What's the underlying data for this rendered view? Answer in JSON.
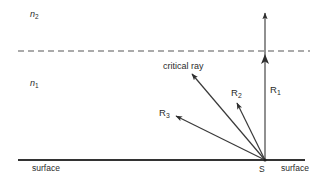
{
  "figure": {
    "width": 322,
    "height": 185,
    "background_color": "#ffffff",
    "line_color": "#3a3a3a",
    "dashed_line_color": "#8a8a8a",
    "text_color": "#2b2b2b"
  },
  "labels": {
    "medium_upper": "n",
    "medium_upper_sub": "2",
    "medium_lower": "n",
    "medium_lower_sub": "1",
    "critical_ray": "critical ray",
    "ray1": "R",
    "ray1_sub": "1",
    "ray2": "R",
    "ray2_sub": "2",
    "ray3": "R",
    "ray3_sub": "3",
    "source_point": "S",
    "surface_left": "surface",
    "surface_right": "surface"
  },
  "geometry": {
    "source_x": 265,
    "source_y": 160,
    "interface_y": 51,
    "interface_x_start": 18,
    "interface_x_end": 310,
    "surface_y": 160,
    "surface_x_start": 18,
    "surface_x_end": 305,
    "rays": [
      {
        "name": "R1",
        "end_x": 265,
        "end_y": 12,
        "arrowheads": 2
      },
      {
        "name": "R2",
        "end_x": 236,
        "end_y": 102,
        "arrowheads": 1
      },
      {
        "name": "critical ray",
        "end_x": 191,
        "end_y": 73,
        "arrowheads": 1
      },
      {
        "name": "R3",
        "end_x": 175,
        "end_y": 116,
        "arrowheads": 1
      }
    ]
  }
}
